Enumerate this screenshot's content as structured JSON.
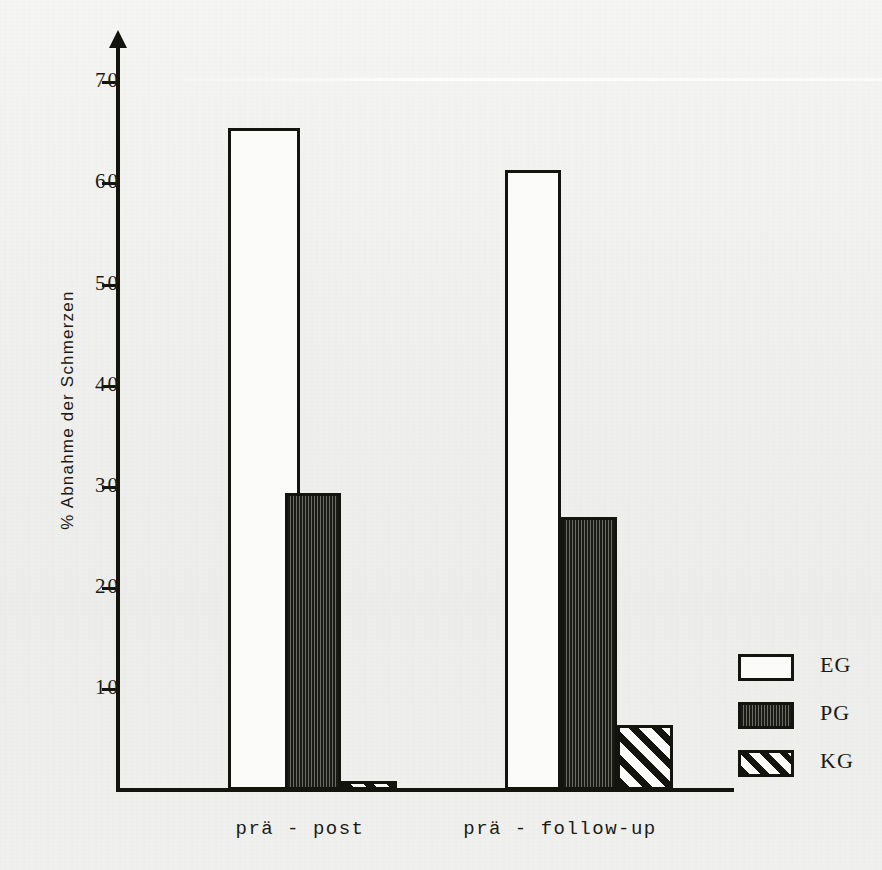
{
  "chart_data": {
    "type": "bar",
    "title": "",
    "subtitle": "",
    "xlabel": "",
    "ylabel": "% Abnahme der Schmerzen",
    "categories": [
      "prä - post",
      "prä - follow-up"
    ],
    "series": [
      {
        "name": "EG",
        "values": [
          65.5,
          61.3
        ],
        "fill": "white-outline"
      },
      {
        "name": "PG",
        "values": [
          29.4,
          27.0
        ],
        "fill": "dense-vertical-hatch"
      },
      {
        "name": "KG",
        "values": [
          0.9,
          6.4
        ],
        "fill": "diagonal-hatch"
      }
    ],
    "ylim": [
      0,
      74
    ],
    "yticks": [
      10,
      20,
      30,
      40,
      50,
      60,
      70
    ],
    "ytick_labels": [
      "10",
      "20",
      "30",
      "40",
      "50",
      "60",
      "70"
    ],
    "grid": false,
    "legend_position": "right-bottom",
    "legend_entries": [
      "EG",
      "PG",
      "KG"
    ],
    "axis_color": "#14140f",
    "background_color": "#f1f1ef"
  },
  "axis": {
    "y_title": "% Abnahme der Schmerzen",
    "ticks": [
      {
        "value": 70,
        "label": "70"
      },
      {
        "value": 60,
        "label": "60"
      },
      {
        "value": 50,
        "label": "50"
      },
      {
        "value": 40,
        "label": "40"
      },
      {
        "value": 30,
        "label": "30"
      },
      {
        "value": 20,
        "label": "20"
      },
      {
        "value": 10,
        "label": "10"
      }
    ]
  },
  "groups": [
    {
      "label": "prä - post"
    },
    {
      "label": "prä - follow-up"
    }
  ],
  "legend": {
    "items": [
      {
        "label": "EG",
        "pattern": "empty"
      },
      {
        "label": "PG",
        "pattern": "vertical-lines"
      },
      {
        "label": "KG",
        "pattern": "diagonal-lines"
      }
    ]
  }
}
